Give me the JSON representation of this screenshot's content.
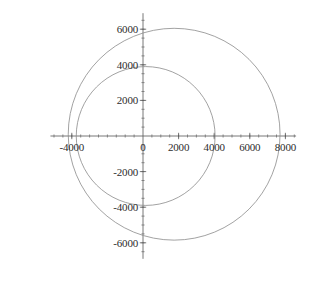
{
  "figure": {
    "frame_color": "#4a4a4a",
    "background_color": "#ffffff",
    "axis_color": "#555555",
    "curve_color": "#8a8a8a"
  },
  "chart_data": {
    "type": "line",
    "title": "",
    "subtitle": "",
    "xlabel": "",
    "ylabel": "",
    "grid": false,
    "legend": null,
    "xlim": [
      -5200,
      8600
    ],
    "ylim": [
      -6900,
      6900
    ],
    "x_ticks": [
      -4000,
      0,
      2000,
      4000,
      6000,
      8000
    ],
    "x_tick_labels": [
      "-4000",
      "0",
      "2000",
      "4000",
      "6000",
      "8000"
    ],
    "y_ticks": [
      6000,
      4000,
      2000,
      0,
      -2000,
      -4000,
      -6000
    ],
    "y_tick_labels": [
      "6000",
      "4000",
      "2000",
      "0",
      "-2000",
      "-4000",
      "-6000"
    ],
    "minor_tick_step": 500,
    "major_tick_step": 2000,
    "series": [
      {
        "name": "inner-circle",
        "shape": "circle",
        "center_x": 150,
        "center_y": 0,
        "radius": 3900
      },
      {
        "name": "outer-circle",
        "shape": "circle",
        "center_x": 1750,
        "center_y": 100,
        "radius": 5950
      }
    ]
  }
}
